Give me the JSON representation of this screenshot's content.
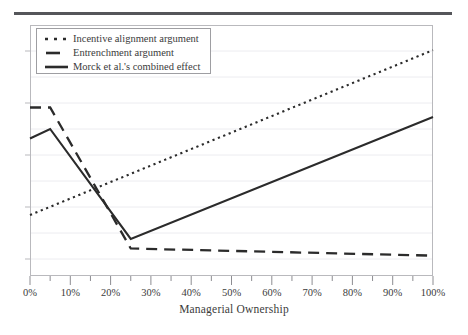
{
  "chart_data": {
    "type": "line",
    "title": "",
    "xlabel": "Managerial Ownership",
    "ylabel": "",
    "xlim": [
      0,
      100
    ],
    "ylim": [
      0,
      100
    ],
    "xtick_labels": [
      "0%",
      "10%",
      "20%",
      "30%",
      "40%",
      "50%",
      "60%",
      "70%",
      "80%",
      "90%",
      "100%"
    ],
    "xtick_values": [
      0,
      10,
      20,
      30,
      40,
      50,
      60,
      70,
      80,
      90,
      100
    ],
    "xminor_tick_step": 5,
    "ytick_labels": [],
    "grid": "horizontal",
    "legend_position": "upper-left-inside",
    "series": [
      {
        "name": "Incentive alignment argument",
        "style": "dotted",
        "x": [
          0,
          100
        ],
        "values": [
          23,
          92
        ]
      },
      {
        "name": "Entrenchment argument",
        "style": "dashed",
        "x": [
          0,
          5,
          25,
          100
        ],
        "values": [
          68,
          68,
          9,
          6
        ]
      },
      {
        "name": "Morck et al.'s combined effect",
        "style": "solid",
        "x": [
          0,
          5,
          25,
          100
        ],
        "values": [
          55,
          59,
          13,
          64
        ]
      }
    ]
  },
  "axis": {
    "x_title": "Managerial Ownership"
  },
  "legend": {
    "entries": [
      {
        "label": "Incentive alignment argument",
        "icon": "dotted-line-swatch"
      },
      {
        "label": "Entrenchment argument",
        "icon": "dashed-line-swatch"
      },
      {
        "label": "Morck et al.'s combined effect",
        "icon": "solid-line-swatch"
      }
    ]
  },
  "colors": {
    "line": "#2b2b2b",
    "frame": "#b9b9bd",
    "grid": "#ececf0",
    "rule": "#55565a",
    "text": "#3b3b3b"
  }
}
